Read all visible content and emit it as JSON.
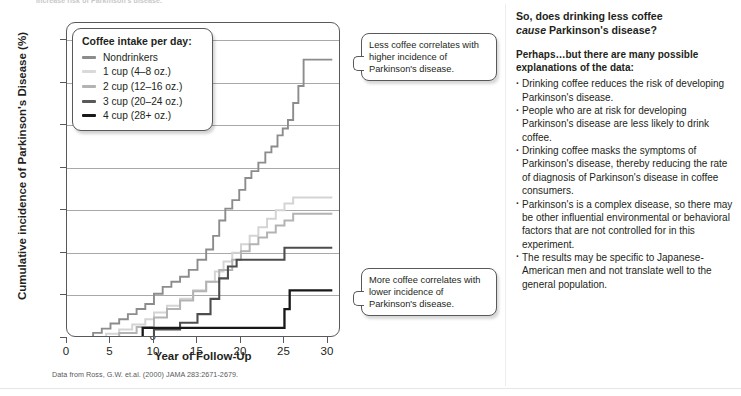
{
  "top_clipped_text": "increase risk of Parkinson's disease.",
  "chart_data": {
    "type": "line",
    "subtype": "step",
    "title": "",
    "xlabel": "Year of Follow-Up",
    "ylabel": "Cumulative incidence of Parkinson's Disease (%)",
    "xlim": [
      0,
      31.5
    ],
    "ylim": [
      0,
      3.7
    ],
    "xticks": [
      0,
      5,
      10,
      15,
      20,
      25,
      30
    ],
    "yticks": [
      0,
      0.5,
      1.0,
      1.5,
      2.0,
      2.5,
      3.0,
      3.5
    ],
    "ytick_labels": [
      "0",
      "0.5",
      "1.0",
      "1.5",
      "2.0",
      "2.5",
      "3.0",
      "3.5"
    ],
    "xtick_labels": [
      "0",
      "5",
      "10",
      "15",
      "20",
      "25",
      "30"
    ],
    "grid": "horizontal",
    "legend_position": "top-left inside",
    "caption": "Data from Ross, G.W. et.al. (2000) JAMA 283:2671-2679.",
    "series": [
      {
        "name": "Nondrinkers",
        "color": "#8c8c8c",
        "width": 1.9,
        "points": [
          [
            2.3,
            0.0
          ],
          [
            3.0,
            0.06
          ],
          [
            4.0,
            0.11
          ],
          [
            5.0,
            0.17
          ],
          [
            6.0,
            0.22
          ],
          [
            7.0,
            0.28
          ],
          [
            8.0,
            0.34
          ],
          [
            9.0,
            0.4
          ],
          [
            10.0,
            0.52
          ],
          [
            11.0,
            0.6
          ],
          [
            12.0,
            0.66
          ],
          [
            13.0,
            0.72
          ],
          [
            14.0,
            0.8
          ],
          [
            15.0,
            0.92
          ],
          [
            16.0,
            1.04
          ],
          [
            16.8,
            1.2
          ],
          [
            17.5,
            1.38
          ],
          [
            18.2,
            1.52
          ],
          [
            19.0,
            1.62
          ],
          [
            19.8,
            1.74
          ],
          [
            20.5,
            1.88
          ],
          [
            21.2,
            1.96
          ],
          [
            22.0,
            2.06
          ],
          [
            22.8,
            2.18
          ],
          [
            23.5,
            2.25
          ],
          [
            24.2,
            2.38
          ],
          [
            24.8,
            2.46
          ],
          [
            25.4,
            2.56
          ],
          [
            26.0,
            2.76
          ],
          [
            26.6,
            2.96
          ],
          [
            27.2,
            3.27
          ],
          [
            30.5,
            3.27
          ]
        ]
      },
      {
        "name": "1 cup (4–8 oz.)",
        "color": "#d4d4d4",
        "width": 2.0,
        "points": [
          [
            3.2,
            0.0
          ],
          [
            4.5,
            0.05
          ],
          [
            6.0,
            0.1
          ],
          [
            7.5,
            0.16
          ],
          [
            9.0,
            0.22
          ],
          [
            10.0,
            0.3
          ],
          [
            11.5,
            0.38
          ],
          [
            13.0,
            0.46
          ],
          [
            14.5,
            0.56
          ],
          [
            16.0,
            0.66
          ],
          [
            17.0,
            0.78
          ],
          [
            18.0,
            0.9
          ],
          [
            19.0,
            1.0
          ],
          [
            20.0,
            1.1
          ],
          [
            21.0,
            1.2
          ],
          [
            22.0,
            1.3
          ],
          [
            23.0,
            1.4
          ],
          [
            24.0,
            1.5
          ],
          [
            25.0,
            1.58
          ],
          [
            26.0,
            1.65
          ],
          [
            30.5,
            1.65
          ]
        ]
      },
      {
        "name": "2 cup (12–16 oz.)",
        "color": "#b3b3b3",
        "width": 2.0,
        "points": [
          [
            4.0,
            0.0
          ],
          [
            6.0,
            0.06
          ],
          [
            8.0,
            0.13
          ],
          [
            10.0,
            0.24
          ],
          [
            11.5,
            0.34
          ],
          [
            13.0,
            0.44
          ],
          [
            14.5,
            0.55
          ],
          [
            16.0,
            0.66
          ],
          [
            17.5,
            0.8
          ],
          [
            19.0,
            0.92
          ],
          [
            20.0,
            1.02
          ],
          [
            21.0,
            1.1
          ],
          [
            22.0,
            1.18
          ],
          [
            23.0,
            1.24
          ],
          [
            24.0,
            1.32
          ],
          [
            25.0,
            1.38
          ],
          [
            26.0,
            1.46
          ],
          [
            30.5,
            1.46
          ]
        ]
      },
      {
        "name": "3 cup (20–24 oz.)",
        "color": "#4d4d4d",
        "width": 2.1,
        "points": [
          [
            8.5,
            0.0
          ],
          [
            10.0,
            0.1
          ],
          [
            13.0,
            0.18
          ],
          [
            15.0,
            0.28
          ],
          [
            16.5,
            0.46
          ],
          [
            17.5,
            0.7
          ],
          [
            18.5,
            0.84
          ],
          [
            19.5,
            0.92
          ],
          [
            24.0,
            0.92
          ],
          [
            25.0,
            1.06
          ],
          [
            30.5,
            1.06
          ]
        ]
      },
      {
        "name": "4 cup (28+ oz.)",
        "color": "#181818",
        "width": 2.3,
        "points": [
          [
            8.5,
            0.0
          ],
          [
            8.7,
            0.12
          ],
          [
            14.0,
            0.12
          ],
          [
            22.0,
            0.12
          ],
          [
            24.5,
            0.12
          ],
          [
            25.0,
            0.34
          ],
          [
            25.6,
            0.56
          ],
          [
            30.5,
            0.56
          ]
        ]
      }
    ]
  },
  "legend": {
    "title": "Coffee intake per day:",
    "items": [
      {
        "label": "Nondrinkers",
        "color": "#8c8c8c",
        "thickness": 2.6
      },
      {
        "label": "1 cup (4–8 oz.)",
        "color": "#d9d9d9",
        "thickness": 2.8
      },
      {
        "label": "2 cup (12–16 oz.)",
        "color": "#b3b3b3",
        "thickness": 2.8
      },
      {
        "label": "3 cup (20–24 oz.)",
        "color": "#595959",
        "thickness": 3.0
      },
      {
        "label": "4 cup (28+ oz.)",
        "color": "#181818",
        "thickness": 3.4
      }
    ]
  },
  "callouts": {
    "upper": "Less coffee correlates with higher incidence of Parkinson's disease.",
    "lower": "More coffee correlates with lower incidence of Parkinson's disease."
  },
  "text_panel": {
    "heading_line1": "So, does drinking less coffee",
    "heading_line2_italic": "cause",
    "heading_line2_rest": " Parkinson's disease?",
    "subheading": "Perhaps…but there are many possible explanations of the data:",
    "bullets": [
      "Drinking coffee reduces the risk of developing Parkinson's disease.",
      "People who are at risk for developing Parkinson's disease are less likely to drink coffee.",
      "Drinking coffee masks the symptoms of Parkinson's disease, thereby reducing the rate of diagnosis of Parkinson's disease in coffee consumers.",
      "Parkinson's is a complex disease, so there may be other influential environmental or behavioral factors that are not controlled for in this experiment.",
      "The results may be specific to Japanese-American men and not translate well to the general population."
    ]
  }
}
